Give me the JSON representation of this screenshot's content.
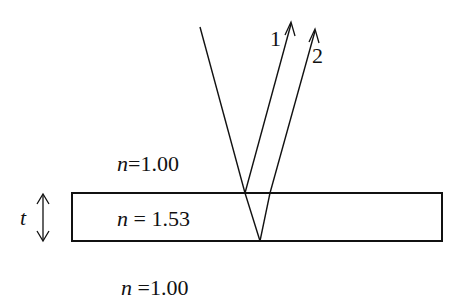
{
  "diagram": {
    "type": "thin-film-interference",
    "colors": {
      "line": "#111111",
      "background": "#ffffff"
    },
    "ray_labels": [
      "1",
      "2"
    ],
    "thickness_label": "t",
    "media": [
      {
        "region": "above",
        "symbol": "n",
        "equals": "=1.00"
      },
      {
        "region": "film",
        "symbol": "n",
        "equals": "= 1.53"
      },
      {
        "region": "below",
        "symbol": "n",
        "equals": "=1.00"
      }
    ]
  }
}
